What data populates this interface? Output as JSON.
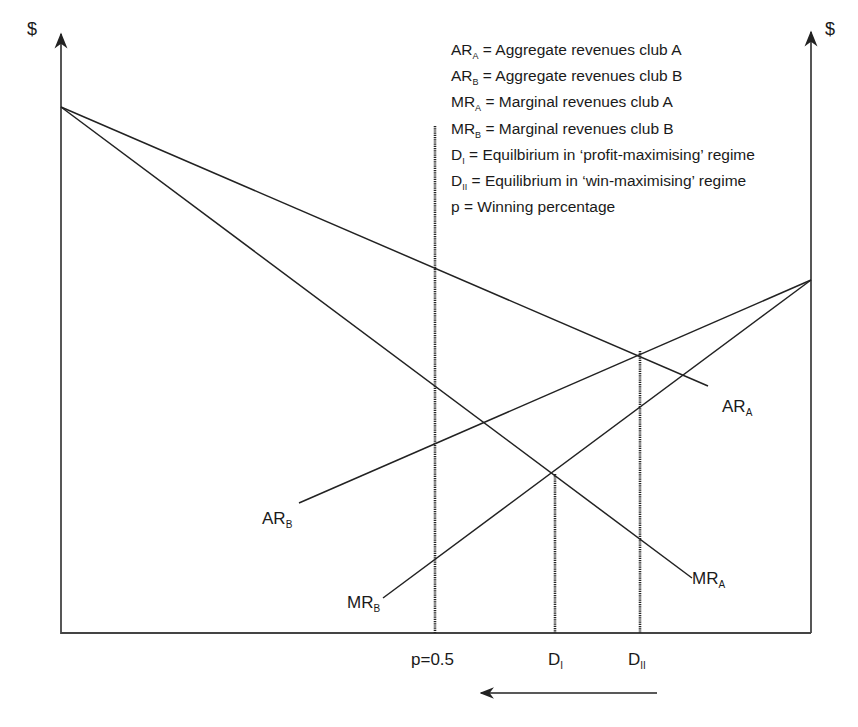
{
  "axes": {
    "left_label": "$",
    "right_label": "$"
  },
  "legend": [
    {
      "sym": "AR",
      "sub": "A",
      "text": " = Aggregate revenues club A"
    },
    {
      "sym": "AR",
      "sub": "B",
      "text": " = Aggregate revenues club B"
    },
    {
      "sym": "MR",
      "sub": "A",
      "text": " = Marginal revenues club A"
    },
    {
      "sym": "MR",
      "sub": "B",
      "text": " = Marginal revenues club B"
    },
    {
      "sym": "D",
      "sub": "I",
      "text": " = Equilbirium in ‘profit-maximising’ regime"
    },
    {
      "sym": "D",
      "sub": "II",
      "text": " = Equilibrium in ‘win-maximising’ regime"
    },
    {
      "sym": "p",
      "sub": "",
      "text": " = Winning percentage"
    }
  ],
  "curves": {
    "ar_a": {
      "sym": "AR",
      "sub": "A"
    },
    "ar_b": {
      "sym": "AR",
      "sub": "B"
    },
    "mr_a": {
      "sym": "MR",
      "sub": "A"
    },
    "mr_b": {
      "sym": "MR",
      "sub": "B"
    }
  },
  "x_markers": {
    "p": "p=0.5",
    "d1": {
      "sym": "D",
      "sub": "I"
    },
    "d2": {
      "sym": "D",
      "sub": "II"
    }
  },
  "colors": {
    "line": "#222222",
    "background": "#ffffff"
  }
}
